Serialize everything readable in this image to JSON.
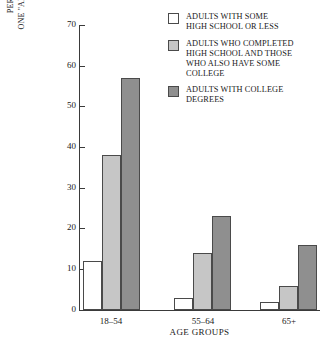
{
  "chart_data": {
    "type": "bar",
    "title": "",
    "subtitle": "",
    "xlabel": "AGE GROUPS",
    "ylabel_lines": [
      "PERCENT OF ADULTS ENROLLED IN AT LEAST",
      "ONE \"ADULT EDUCATION\" CLASS (SCHOOL, AT WORK,",
      "OR ELSEWHERE) IN 1981"
    ],
    "ylabel": "PERCENT OF ADULTS ENROLLED IN AT LEAST ONE \"ADULT EDUCATION\" CLASS (SCHOOL, AT WORK, OR ELSEWHERE) IN 1981",
    "categories": [
      "18–54",
      "55–64",
      "65+"
    ],
    "series": [
      {
        "name": "ADULTS WITH SOME HIGH SCHOOL OR LESS",
        "name_lines": [
          "ADULTS WITH SOME",
          "HIGH SCHOOL OR LESS"
        ],
        "color": "#ffffff",
        "values": [
          12,
          3,
          2
        ]
      },
      {
        "name": "ADULTS WHO COMPLETED HIGH SCHOOL AND THOSE WHO ALSO HAVE SOME COLLEGE",
        "name_lines": [
          "ADULTS WHO COMPLETED",
          "HIGH SCHOOL AND THOSE",
          "WHO ALSO HAVE SOME",
          "COLLEGE"
        ],
        "color": "#c6c6c6",
        "values": [
          38,
          14,
          6
        ]
      },
      {
        "name": "ADULTS WITH COLLEGE DEGREES",
        "name_lines": [
          "ADULTS WITH COLLEGE",
          "DEGREES"
        ],
        "color": "#8f8f8f",
        "values": [
          57,
          23,
          16
        ]
      }
    ],
    "ylim": [
      0,
      70
    ],
    "yticks": [
      0,
      10,
      20,
      30,
      40,
      50,
      60,
      70
    ],
    "ytick_labels": [
      "0",
      "10",
      "20",
      "30",
      "40",
      "50",
      "60",
      "70"
    ],
    "grid": false,
    "legend_position": "top-right"
  }
}
